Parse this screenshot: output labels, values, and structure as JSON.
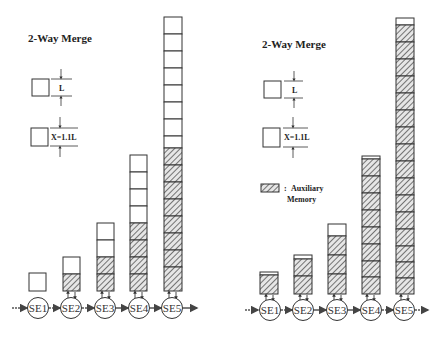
{
  "panels": [
    {
      "id": "left",
      "title": "2-Way Merge",
      "legend": {
        "box_l_label": "L",
        "box_x_label": "X=1.1L"
      },
      "stages": [
        {
          "label": "SE1",
          "white_cells": 1,
          "hatched_cells": 0,
          "connected": false
        },
        {
          "label": "SE2",
          "white_cells": 1,
          "hatched_cells": 1,
          "connected": true
        },
        {
          "label": "SE3",
          "white_cells": 2,
          "hatched_cells": 2,
          "connected": true
        },
        {
          "label": "SE4",
          "white_cells": 4,
          "hatched_cells": 4,
          "connected": true
        },
        {
          "label": "SE5",
          "white_cells": 8,
          "hatched_cells": 8,
          "connected": true
        }
      ]
    },
    {
      "id": "right",
      "title": "2-Way Merge",
      "legend": {
        "box_l_label": "L",
        "box_x_label": "X=1.1L",
        "aux_colon": ":",
        "aux_label_line1": "Auxiliary",
        "aux_label_line2": "Memory"
      },
      "stages": [
        {
          "label": "SE1",
          "hatched_cells": 1,
          "white_fraction": 0.1
        },
        {
          "label": "SE2",
          "hatched_cells": 2,
          "white_fraction": 0.2
        },
        {
          "label": "SE3",
          "hatched_cells": 3,
          "white_fraction": 1.0
        },
        {
          "label": "SE4",
          "hatched_cells": 8,
          "white_fraction": 0.2
        },
        {
          "label": "SE5",
          "hatched_cells": 16,
          "white_fraction": 0.6
        }
      ]
    }
  ],
  "colors": {
    "stroke": "#333333",
    "hatch": "#555555",
    "background": "#ffffff"
  }
}
